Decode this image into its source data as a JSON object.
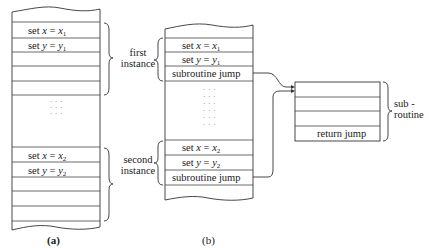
{
  "figure_a": {
    "caption": "(a)",
    "rows": [
      {
        "var": "x",
        "val": "x",
        "sub": "1"
      },
      {
        "var": "y",
        "val": "y",
        "sub": "1"
      },
      {
        "var": "x",
        "val": "x",
        "sub": "2"
      },
      {
        "var": "y",
        "val": "y",
        "sub": "2"
      }
    ],
    "set_word": "set",
    "eq": "="
  },
  "figure_b": {
    "caption": "(b)",
    "first_instance_line1": "first",
    "first_instance_line2": "instance",
    "second_instance_line1": "second",
    "second_instance_line2": "instance",
    "subroutine_jump": "subroutine jump"
  },
  "subroutine": {
    "label_line1": "sub -",
    "label_line2": "routine",
    "return_jump": "return jump"
  },
  "dots_glyph": "· · ·"
}
